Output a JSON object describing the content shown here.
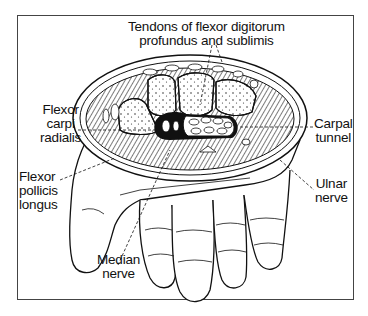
{
  "diagram": {
    "labels": {
      "tendons": {
        "line1": "Tendons of flexor digitorum",
        "line2": "profundus and sublimis"
      },
      "flexor_carpi_radialis": {
        "line1": "Flexor",
        "line2": "carpi",
        "line3": "radialis"
      },
      "carpal_tunnel": {
        "line1": "Carpal",
        "line2": "tunnel"
      },
      "flexor_pollicis_longus": {
        "line1": "Flexor",
        "line2": "pollicis",
        "line3": "longus"
      },
      "ulnar_nerve": {
        "line1": "Ulnar",
        "line2": "nerve"
      },
      "median_nerve": {
        "line1": "Median",
        "line2": "nerve"
      }
    },
    "colors": {
      "ink": "#111111",
      "frame": "#444444",
      "background": "#ffffff"
    }
  }
}
